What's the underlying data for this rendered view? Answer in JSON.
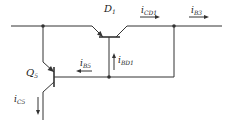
{
  "diagram": {
    "type": "circuit-schematic",
    "components": [
      {
        "id": "D1",
        "label": "D",
        "sub": "1",
        "kind": "transistor (diode-connected)"
      },
      {
        "id": "Q5",
        "label": "Q",
        "sub": "5",
        "kind": "transistor"
      }
    ],
    "currents": [
      {
        "id": "iCD1",
        "label": "i",
        "sub": "CD1",
        "direction": "right"
      },
      {
        "id": "iB3",
        "label": "i",
        "sub": "B3",
        "direction": "right"
      },
      {
        "id": "iBD1",
        "label": "i",
        "sub": "BD1",
        "direction": "up"
      },
      {
        "id": "iB5",
        "label": "i",
        "sub": "B5",
        "direction": "left"
      },
      {
        "id": "iC5",
        "label": "i",
        "sub": "C5",
        "direction": "down"
      }
    ],
    "line_color": "#333333"
  }
}
